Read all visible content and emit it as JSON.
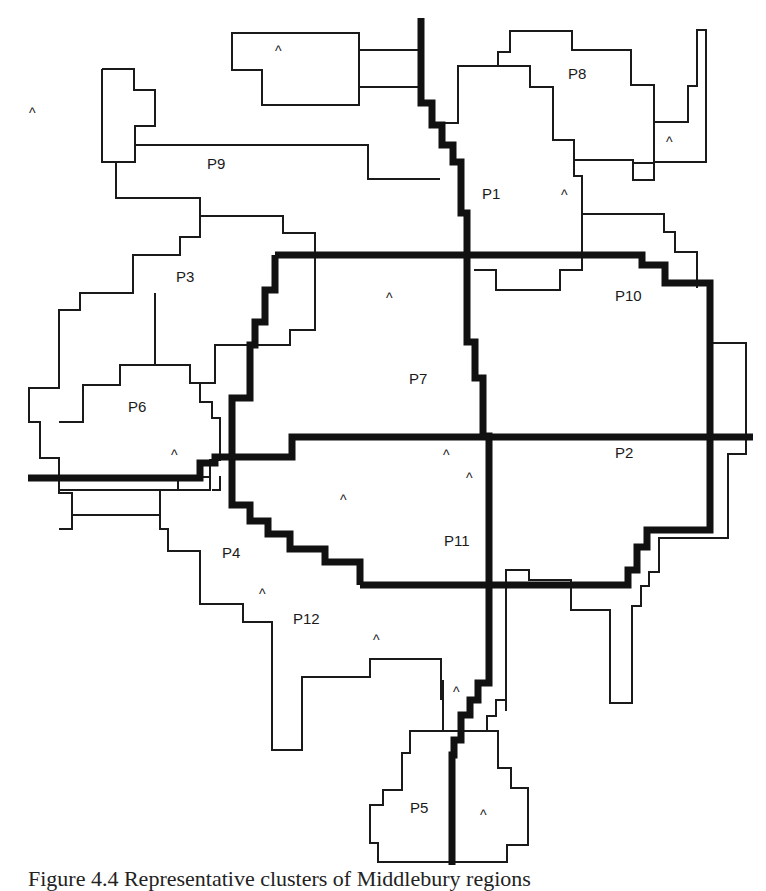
{
  "figure": {
    "caption": "Figure 4.4 Representative clusters of Middlebury regions",
    "colors": {
      "stroke": "#1a1a1a",
      "background": "#ffffff"
    }
  },
  "regions": [
    {
      "id": "P1",
      "label": "P1",
      "x": 482,
      "y": 199
    },
    {
      "id": "P2",
      "label": "P2",
      "x": 615,
      "y": 458
    },
    {
      "id": "P3",
      "label": "P3",
      "x": 176,
      "y": 282
    },
    {
      "id": "P4",
      "label": "P4",
      "x": 222,
      "y": 558
    },
    {
      "id": "P5",
      "label": "P5",
      "x": 410,
      "y": 813
    },
    {
      "id": "P6",
      "label": "P6",
      "x": 128,
      "y": 412
    },
    {
      "id": "P7",
      "label": "P7",
      "x": 409,
      "y": 384
    },
    {
      "id": "P8",
      "label": "P8",
      "x": 568,
      "y": 79
    },
    {
      "id": "P9",
      "label": "P9",
      "x": 207,
      "y": 169
    },
    {
      "id": "P10",
      "label": "P10",
      "x": 615,
      "y": 301
    },
    {
      "id": "P11",
      "label": "P11",
      "x": 444,
      "y": 546
    },
    {
      "id": "P12",
      "label": "P12",
      "x": 293,
      "y": 624
    }
  ],
  "markers": {
    "glyph": "^",
    "positions": [
      {
        "x": 29,
        "y": 118
      },
      {
        "x": 275,
        "y": 56
      },
      {
        "x": 666,
        "y": 147
      },
      {
        "x": 561,
        "y": 200
      },
      {
        "x": 386,
        "y": 303
      },
      {
        "x": 171,
        "y": 460
      },
      {
        "x": 443,
        "y": 460
      },
      {
        "x": 466,
        "y": 483
      },
      {
        "x": 340,
        "y": 505
      },
      {
        "x": 259,
        "y": 599
      },
      {
        "x": 373,
        "y": 645
      },
      {
        "x": 453,
        "y": 697
      },
      {
        "x": 480,
        "y": 820
      }
    ]
  }
}
